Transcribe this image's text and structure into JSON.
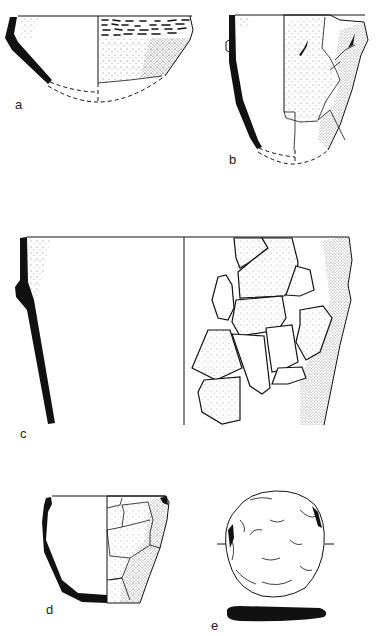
{
  "figure": {
    "background": "#ffffff",
    "ink_color": "#111111",
    "items": [
      {
        "id": "a",
        "label": "a",
        "description": "Shallow bowl, profile section with reconstructed base, rim band of impressed dashes"
      },
      {
        "id": "b",
        "label": "b",
        "description": "Deep rounded vessel with lug, profile section, fragmentary exterior"
      },
      {
        "id": "c",
        "label": "c",
        "description": "Large flared vessel, profile section, reassembled sherds"
      },
      {
        "id": "d",
        "label": "d",
        "description": "Small carinated pot, profile section, sherd mosaic exterior"
      },
      {
        "id": "e",
        "label": "e",
        "description": "Disc / round object, plan view with section below"
      }
    ]
  }
}
